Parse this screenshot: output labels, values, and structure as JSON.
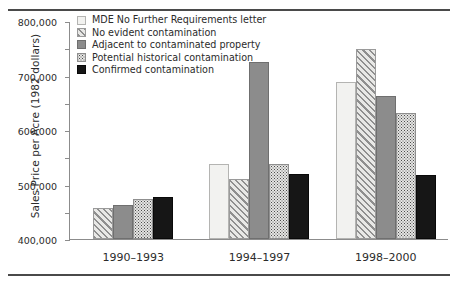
{
  "chart_data": {
    "type": "bar",
    "title": "",
    "xlabel": "",
    "ylabel": "Sales Price per Acre (1982 dollars)",
    "categories": [
      "1990–1993",
      "1994–1997",
      "1998–2000"
    ],
    "ylim": [
      0,
      800000
    ],
    "yticks": [
      0,
      100000,
      200000,
      300000,
      400000,
      500000,
      600000,
      700000,
      800000
    ],
    "ytick_labels": [
      "0",
      "100,000",
      "200,000",
      "300,000",
      "400,000",
      "500,000",
      "600,000",
      "700,000",
      "800,000"
    ],
    "grid": false,
    "legend_position": "top-left-inside",
    "series": [
      {
        "name": "MDE No Further Requirements letter",
        "key": "mde",
        "fill": "light-open",
        "color": "#f2f2f0",
        "values": [
          null,
          277000,
          578000
        ]
      },
      {
        "name": "No evident contamination",
        "key": "no_evident",
        "fill": "diagonal-hatch",
        "color": "#e8e8e6",
        "values": [
          112000,
          222000,
          697000
        ]
      },
      {
        "name": "Adjacent to contaminated property",
        "key": "adjacent",
        "fill": "solid-gray",
        "color": "#8c8c8c",
        "values": [
          125000,
          648000,
          525000
        ]
      },
      {
        "name": "Potential historical contamination",
        "key": "potential_historical",
        "fill": "dotted-speckle",
        "color": "#e4e4e2",
        "values": [
          148000,
          275000,
          462000
        ]
      },
      {
        "name": "Confirmed contamination",
        "key": "confirmed",
        "fill": "solid-black",
        "color": "#161616",
        "values": [
          155000,
          238000,
          235000
        ]
      }
    ]
  }
}
